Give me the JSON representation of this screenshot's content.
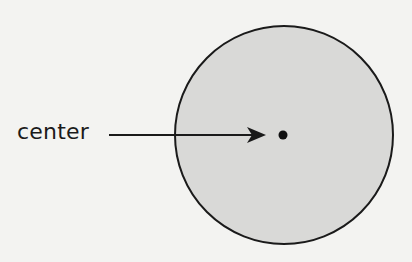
{
  "diagram": {
    "label": "center",
    "circle": {
      "cx": 284,
      "cy": 135,
      "r": 109,
      "fill": "#d9d9d7",
      "stroke": "#1a1a1a"
    },
    "center_point": {
      "cx": 283,
      "cy": 135,
      "r": 4.5
    },
    "arrow": {
      "x1": 109,
      "y1": 135,
      "x2": 266,
      "y2": 135
    }
  }
}
